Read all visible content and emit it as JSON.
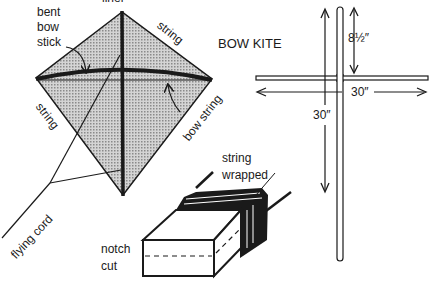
{
  "diagram": {
    "title": "BOW KITE",
    "kite_labels": {
      "top_cut": "liner",
      "bent_bow_stick": [
        "bent",
        "bow",
        "stick"
      ],
      "string_top_right": "string",
      "string_left": "string",
      "bow_string": "bow string",
      "flying_cord": "flying cord"
    },
    "frame_dimensions": {
      "top_to_crossbar": "8½″",
      "crossbar_width": "30″",
      "spine_length": "30″"
    },
    "notch_detail": {
      "string_wrapped": [
        "string",
        "wrapped"
      ],
      "notch_cut": [
        "notch",
        "cut"
      ]
    },
    "colors": {
      "ink": "#1a1a1a",
      "kite_fill": "#bdbdbd"
    }
  }
}
